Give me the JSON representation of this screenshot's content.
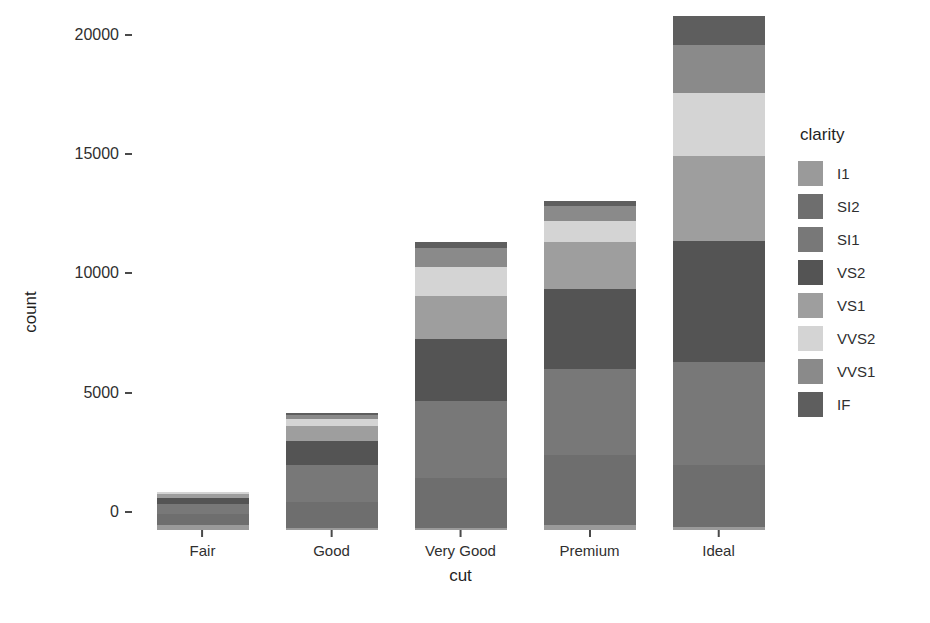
{
  "chart_data": {
    "type": "bar",
    "stacked": true,
    "title": "",
    "xlabel": "cut",
    "ylabel": "count",
    "categories": [
      "Fair",
      "Good",
      "Very Good",
      "Premium",
      "Ideal"
    ],
    "ylim": [
      0,
      21700
    ],
    "yticks": [
      0,
      5000,
      10000,
      15000,
      20000
    ],
    "ytick_labels": [
      "0",
      "5000",
      "10000",
      "15000",
      "20000"
    ],
    "grid": false,
    "legend_position": "right",
    "legend_title": "clarity",
    "series": [
      {
        "name": "I1",
        "color": "#9a9a9a",
        "values": [
          210,
          96,
          84,
          205,
          146
        ]
      },
      {
        "name": "SI2",
        "color": "#6e6e6e",
        "values": [
          466,
          1081,
          2100,
          2949,
          2598
        ]
      },
      {
        "name": "SI1",
        "color": "#787878",
        "values": [
          408,
          1560,
          3240,
          3575,
          4282
        ]
      },
      {
        "name": "VS2",
        "color": "#545454",
        "values": [
          261,
          978,
          2591,
          3357,
          5071
        ]
      },
      {
        "name": "VS1",
        "color": "#9e9e9e",
        "values": [
          170,
          648,
          1775,
          1989,
          3589
        ]
      },
      {
        "name": "VVS2",
        "color": "#d4d4d4",
        "values": [
          69,
          286,
          1235,
          870,
          2606
        ]
      },
      {
        "name": "VVS1",
        "color": "#8a8a8a",
        "values": [
          17,
          186,
          789,
          616,
          2047
        ]
      },
      {
        "name": "IF",
        "color": "#5e5e5e",
        "values": [
          9,
          71,
          268,
          230,
          1212
        ]
      }
    ],
    "totals": [
      1610,
      4906,
      12082,
      13791,
      21551
    ]
  },
  "axis": {
    "y_title": "count",
    "x_title": "cut"
  }
}
